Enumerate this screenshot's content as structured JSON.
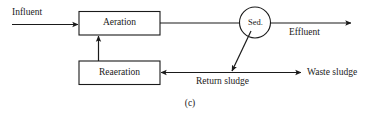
{
  "figure": {
    "caption": "(c)",
    "stroke_color": "#1a1a1a",
    "background_color": "#ffffff"
  },
  "nodes": {
    "aeration": {
      "label": "Aeration",
      "shape": "rectangle"
    },
    "reaeration": {
      "label": "Reaeration",
      "shape": "rectangle"
    },
    "sedimentation": {
      "label": "Sed.",
      "shape": "circle"
    }
  },
  "flows": {
    "influent": {
      "label": "Influent"
    },
    "effluent": {
      "label": "Effluent"
    },
    "return_sludge": {
      "label": "Return sludge"
    },
    "waste_sludge": {
      "label": "Waste sludge"
    }
  }
}
